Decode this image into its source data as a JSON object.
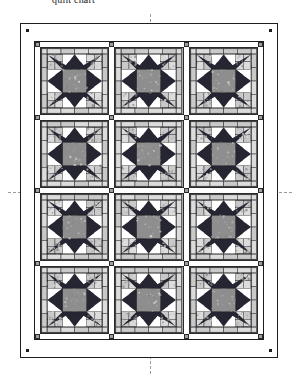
{
  "caption": "quilt chart",
  "document": {
    "type": "quilt-pattern-diagram",
    "title": "Sawtooth Star Sampler Quilt Layout"
  },
  "layout": {
    "block_rows": 4,
    "block_columns": 3,
    "total_blocks": 12,
    "sashing": "white with gray cornerstones",
    "border": "plain white outer border",
    "corner_marker_count": 4
  },
  "colors": {
    "background": "#ffffff",
    "star_points": "#262633",
    "star_center": "#8e8e8e",
    "corner_patch_light": "#dcdcdc",
    "corner_patch_print": "#c9c9c9",
    "sashing": "#ffffff",
    "cornerstone": "#9d9d9d",
    "outline": "#1d1d1d",
    "guide_line": "#9a9a9a"
  },
  "guides": {
    "vertical_label": "vertical center line",
    "horizontal_label": "horizontal center line"
  },
  "blocks": [
    {
      "id": "block-r1-c1",
      "name": "sawtooth-star",
      "row": 1,
      "col": 1
    },
    {
      "id": "block-r1-c2",
      "name": "sawtooth-star",
      "row": 1,
      "col": 2
    },
    {
      "id": "block-r1-c3",
      "name": "sawtooth-star",
      "row": 1,
      "col": 3
    },
    {
      "id": "block-r2-c1",
      "name": "sawtooth-star",
      "row": 2,
      "col": 1
    },
    {
      "id": "block-r2-c2",
      "name": "sawtooth-star",
      "row": 2,
      "col": 2
    },
    {
      "id": "block-r2-c3",
      "name": "sawtooth-star",
      "row": 2,
      "col": 3
    },
    {
      "id": "block-r3-c1",
      "name": "sawtooth-star",
      "row": 3,
      "col": 1
    },
    {
      "id": "block-r3-c2",
      "name": "sawtooth-star",
      "row": 3,
      "col": 2
    },
    {
      "id": "block-r3-c3",
      "name": "sawtooth-star",
      "row": 3,
      "col": 3
    },
    {
      "id": "block-r4-c1",
      "name": "sawtooth-star",
      "row": 4,
      "col": 1
    },
    {
      "id": "block-r4-c2",
      "name": "sawtooth-star",
      "row": 4,
      "col": 2
    },
    {
      "id": "block-r4-c3",
      "name": "sawtooth-star",
      "row": 4,
      "col": 3
    }
  ],
  "cornerstones": {
    "rows": 5,
    "columns": 4,
    "count": 20
  }
}
